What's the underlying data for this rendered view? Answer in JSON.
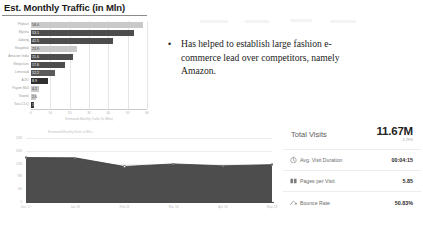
{
  "slide": {
    "title": "Est. Monthly Traffic (in Mln)"
  },
  "bullet": {
    "marker": "•",
    "text": "Has helped to establish large fashion e-commerce lead over competitors, namely Amazon."
  },
  "stats": {
    "hero": {
      "label": "Total Visits",
      "value": "11.67M",
      "delta": "-1.79%"
    },
    "rows": [
      {
        "icon": "clock-icon",
        "label": "Avg. Visit Duration",
        "value": "00:04:15"
      },
      {
        "icon": "pages-icon",
        "label": "Pages per Visit",
        "value": "5.85"
      },
      {
        "icon": "bounce-icon",
        "label": "Bounce Rate",
        "value": "50.83%"
      }
    ]
  },
  "chart_data": [
    {
      "type": "bar",
      "orientation": "horizontal",
      "title": "Est. Monthly Traffic (in Mln)",
      "xlabel": "Estimated Monthly Traffic (in Mlns)",
      "ylabel": "",
      "categories": [
        "Flipkart",
        "Myntra",
        "Jabong",
        "Snapdeal",
        "Amazon India",
        "Shopclues",
        "Limeroad",
        "AJIO",
        "Paytm Mall",
        "Voonik",
        "Tata CLiQ"
      ],
      "values": [
        58.0,
        53.1,
        42.5,
        23.9,
        21.6,
        17.6,
        12.2,
        8.9,
        4.2,
        2.6,
        1.3
      ],
      "bar_labels": [
        "58.0",
        "53.1",
        "42.5",
        "23.9",
        "21.6",
        "17.6",
        "12.2",
        "8.9",
        "4.2",
        "2.6",
        "1.3"
      ],
      "bar_colors": [
        "#c9c9c9",
        "#4d4d4d",
        "#4d4d4d",
        "#c9c9c9",
        "#4d4d4d",
        "#4d4d4d",
        "#5a5a5a",
        "#303030",
        "#c9c9c9",
        "#c9c9c9",
        "#303030"
      ],
      "xticks": [
        "0",
        "10",
        "20",
        "30",
        "40",
        "50",
        "60"
      ],
      "xlim": [
        0,
        60
      ],
      "grid": true,
      "legend": "none"
    },
    {
      "type": "area",
      "title": "",
      "caption": "Estimated Monthly Visits in Mlns",
      "x": [
        "Dec 17",
        "Jan 18",
        "Feb 18",
        "Mar 18",
        "Apr 18",
        "May 18"
      ],
      "values": [
        13.9,
        13.8,
        11.1,
        11.9,
        11.3,
        11.67
      ],
      "yticks": [
        "0",
        "4M",
        "8M",
        "12M",
        "16M",
        "20M"
      ],
      "ylim": [
        0,
        20
      ],
      "xlabel": "",
      "ylabel": "",
      "grid": true,
      "area_color": "#4d4d4d",
      "legend": "none"
    }
  ]
}
